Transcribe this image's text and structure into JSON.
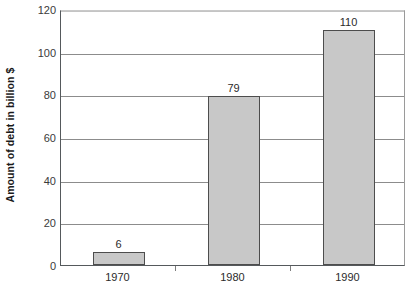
{
  "chart_data": {
    "type": "bar",
    "title": "",
    "subtitle": "",
    "categories": [
      "1970",
      "1980",
      "1990"
    ],
    "values": [
      6,
      79,
      110
    ],
    "data_labels": [
      "6",
      "79",
      "110"
    ],
    "xlabel": "",
    "ylabel": "Amount of debt in billion $",
    "ylim": [
      0,
      120
    ],
    "y_ticks": [
      0,
      20,
      40,
      60,
      80,
      100,
      120
    ],
    "y_tick_labels": [
      "0",
      "20",
      "40",
      "60",
      "80",
      "100",
      "120"
    ],
    "grid": "horizontal",
    "legend": "none",
    "bar_fill_color": "#c8c8c8",
    "bar_border_color": "#4d4d4d",
    "axis_color": "#55595c",
    "gridline_color": "#8c8c8c",
    "background_color": "#ffffff",
    "annotations": []
  }
}
